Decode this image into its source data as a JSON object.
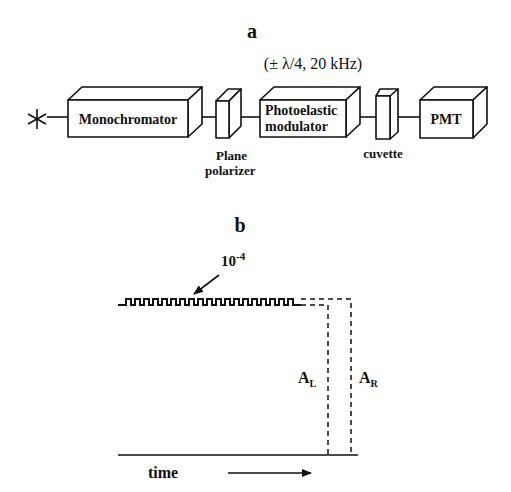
{
  "panel_a": {
    "label": "a",
    "modulation_note": "(± λ/4, 20 kHz)",
    "source_symbol": "*",
    "components": [
      {
        "id": "monochromator",
        "label": "Monochromator"
      },
      {
        "id": "plane-polarizer",
        "label_line1": "Plane",
        "label_line2": "polarizer"
      },
      {
        "id": "photoelastic-modulator",
        "label_line1": "Photoelastic",
        "label_line2": "modulator"
      },
      {
        "id": "cuvette",
        "label": "cuvette"
      },
      {
        "id": "pmt",
        "label": "PMT"
      }
    ]
  },
  "panel_b": {
    "label": "b",
    "amplitude_label": "10",
    "amplitude_exponent": "-4",
    "al_label": "A",
    "al_sub": "L",
    "ar_label": "A",
    "ar_sub": "R",
    "axis_label": "time"
  }
}
